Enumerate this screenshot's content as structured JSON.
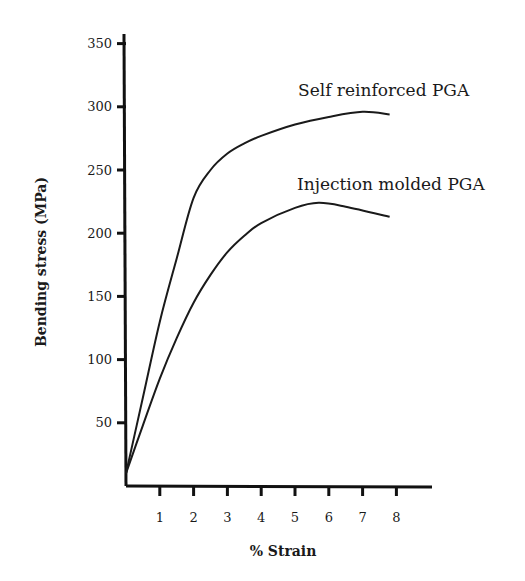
{
  "chart_data": {
    "type": "line",
    "title": "",
    "xlabel": "% Strain",
    "ylabel": "Bending stress (MPa)",
    "xlim": [
      0,
      9
    ],
    "ylim": [
      0,
      360
    ],
    "x_ticks": [
      1,
      2,
      3,
      4,
      5,
      6,
      7,
      8
    ],
    "x_tick_labels": [
      "1",
      "2",
      "3",
      "4",
      "5",
      "6",
      "7",
      "8"
    ],
    "y_ticks": [
      50,
      100,
      150,
      200,
      250,
      300,
      350
    ],
    "y_tick_labels": [
      "50",
      "100",
      "150",
      "200",
      "250",
      "300",
      "350"
    ],
    "grid": false,
    "legend": "inline labels near curve ends",
    "series": [
      {
        "name": "Self reinforced PGA",
        "x": [
          0,
          0.5,
          1,
          1.5,
          2,
          2.5,
          3,
          3.5,
          4,
          5,
          6,
          7,
          7.8
        ],
        "y": [
          10,
          70,
          130,
          180,
          228,
          250,
          263,
          271,
          277,
          286,
          292,
          296,
          294
        ]
      },
      {
        "name": "Injection molded PGA",
        "x": [
          0,
          0.5,
          1,
          1.5,
          2,
          2.5,
          3,
          3.5,
          4,
          5,
          5.7,
          6.5,
          7.8
        ],
        "y": [
          10,
          48,
          85,
          117,
          145,
          167,
          185,
          198,
          208,
          220,
          224,
          221,
          213
        ]
      }
    ]
  }
}
